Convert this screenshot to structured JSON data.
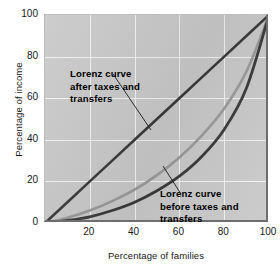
{
  "chart_data": {
    "type": "line",
    "title": "",
    "xlabel": "Percentage of families",
    "ylabel": "Percentage of income",
    "xlim": [
      0,
      100
    ],
    "ylim": [
      0,
      100
    ],
    "grid": true,
    "legend": "none (inline annotations)",
    "xticks": [
      "20",
      "40",
      "60",
      "80",
      "100"
    ],
    "xtick_values": [
      20,
      40,
      60,
      80,
      100
    ],
    "yticks": [
      "0",
      "20",
      "40",
      "60",
      "80",
      "100"
    ],
    "ytick_values": [
      0,
      20,
      40,
      60,
      80,
      100
    ],
    "x": [
      0,
      10,
      20,
      30,
      40,
      50,
      60,
      70,
      80,
      90,
      100
    ],
    "series": [
      {
        "name": "Line of equality",
        "color": "#3a3a3a",
        "values": [
          0,
          10,
          20,
          30,
          40,
          50,
          60,
          70,
          80,
          90,
          100
        ]
      },
      {
        "name": "Lorenz curve after taxes and transfers",
        "color": "#9a9a9a",
        "values": [
          0,
          2.5,
          6,
          10.5,
          16,
          23,
          31.5,
          42,
          55,
          73,
          100
        ]
      },
      {
        "name": "Lorenz curve before taxes and transfers",
        "color": "#3a3a3a",
        "values": [
          0,
          1.2,
          3,
          6,
          10,
          15.5,
          22.5,
          32,
          45,
          65,
          100
        ]
      }
    ],
    "annotations": [
      {
        "id": "after",
        "lines": [
          "Lorenz curve",
          "after taxes and",
          "transfers"
        ],
        "points_to": "Lorenz curve after taxes and transfers"
      },
      {
        "id": "before",
        "lines": [
          "Lorenz curve",
          "before taxes and",
          "transfers"
        ],
        "points_to": "Lorenz curve before taxes and transfers"
      }
    ]
  },
  "colors": {
    "plot_background": "#c9c9c9",
    "gridline": "#f2f2f2",
    "axis_frame": "#6e6e6e",
    "dark_curve": "#3a3a3a",
    "light_curve": "#9a9a9a",
    "text": "#1a1a1a",
    "page_background": "#ffffff"
  }
}
